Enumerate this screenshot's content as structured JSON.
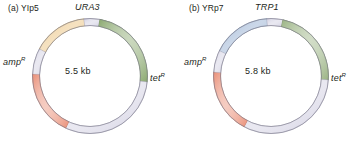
{
  "figure": {
    "panels": [
      {
        "caption": "(a) YIp5",
        "size": "5.5 kb",
        "gene_label": "URA3",
        "amp_label": "amp",
        "amp_sup": "R",
        "tet_label": "tet",
        "tet_sup": "R",
        "segments": [
          {
            "name": "URA3",
            "color": "#e9bd73",
            "edge": "#b08b3f",
            "start_deg": -62,
            "end_deg": -6
          },
          {
            "name": "spacer-1",
            "color": "#cfcde0",
            "edge": "#9b99ae",
            "start_deg": -6,
            "end_deg": 10
          },
          {
            "name": "tetR",
            "color": "#8aa86f",
            "edge": "#5e7a47",
            "start_deg": 10,
            "end_deg": 96
          },
          {
            "name": "backbone",
            "color": "#cfcde0",
            "edge": "#9b99ae",
            "start_deg": 96,
            "end_deg": 205
          },
          {
            "name": "ampR",
            "color": "#e98e76",
            "edge": "#b25e46",
            "start_deg": 205,
            "end_deg": 272
          },
          {
            "name": "spacer-2",
            "color": "#cfcde0",
            "edge": "#9b99ae",
            "start_deg": 272,
            "end_deg": 298
          }
        ]
      },
      {
        "caption": "(b) YRp7",
        "size": "5.8 kb",
        "gene_label": "TRP1",
        "amp_label": "amp",
        "amp_sup": "R",
        "tet_label": "tet",
        "tet_sup": "R",
        "segments": [
          {
            "name": "TRP1",
            "color": "#8ba7cd",
            "edge": "#566f92",
            "start_deg": -64,
            "end_deg": -4
          },
          {
            "name": "spacer-1",
            "color": "#cfcde0",
            "edge": "#9b99ae",
            "start_deg": -4,
            "end_deg": 12
          },
          {
            "name": "tetR",
            "color": "#9ab383",
            "edge": "#667f4f",
            "start_deg": 12,
            "end_deg": 94
          },
          {
            "name": "backbone",
            "color": "#cfcde0",
            "edge": "#9b99ae",
            "start_deg": 94,
            "end_deg": 208
          },
          {
            "name": "ampR",
            "color": "#e98e76",
            "edge": "#b25e46",
            "start_deg": 208,
            "end_deg": 274
          },
          {
            "name": "spacer-2",
            "color": "#cfcde0",
            "edge": "#9b99ae",
            "start_deg": 274,
            "end_deg": 296
          }
        ]
      }
    ],
    "geometry": {
      "cx": 90,
      "cy": 76,
      "radius": 54,
      "ring_width": 7
    }
  }
}
